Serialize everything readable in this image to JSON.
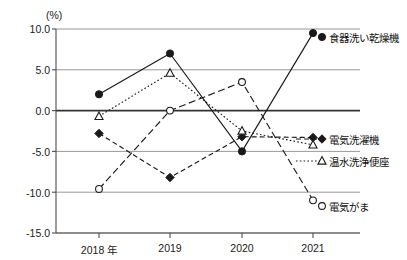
{
  "axis": {
    "unit": "(%)",
    "y_ticks": [
      "10.0",
      "5.0",
      "0.0",
      "-5.0",
      "-10.0",
      "-15.0"
    ],
    "x_ticks": [
      "2018 年",
      "2019",
      "2020",
      "2021"
    ]
  },
  "legend": [
    {
      "label": "食器洗い乾燥機",
      "marker": "filled-circle",
      "line": "solid"
    },
    {
      "label": "電気洗濯機",
      "marker": "filled-diamond",
      "line": "dashed"
    },
    {
      "label": "温水洗浄便座",
      "marker": "open-triangle",
      "line": "dotted"
    },
    {
      "label": "電気がま",
      "marker": "open-circle",
      "line": "dashdot"
    }
  ],
  "colors": {
    "axis": "#4d4d4d",
    "grid": "#8c8c8c",
    "zero_line": "#333333",
    "series": "#1a1a1a",
    "background": "#ffffff"
  },
  "chart_data": {
    "type": "line",
    "title": "",
    "subtitle": "",
    "xlabel": "",
    "ylabel": "(%)",
    "categories": [
      "2018 年",
      "2019",
      "2020",
      "2021"
    ],
    "x": [
      2018,
      2019,
      2020,
      2021
    ],
    "ylim": [
      -15.0,
      10.0
    ],
    "y_ticks": [
      10.0,
      5.0,
      0.0,
      -5.0,
      -10.0,
      -15.0
    ],
    "grid": true,
    "legend_position": "right-inline",
    "series": [
      {
        "name": "食器洗い乾燥機",
        "marker": "filled-circle",
        "line": "solid",
        "values": [
          2.0,
          7.0,
          -5.0,
          9.5
        ]
      },
      {
        "name": "電気洗濯機",
        "marker": "filled-diamond",
        "line": "dashed",
        "values": [
          -2.8,
          -8.2,
          -3.2,
          -3.3
        ]
      },
      {
        "name": "温水洗浄便座",
        "marker": "open-triangle",
        "line": "dotted",
        "values": [
          -0.7,
          4.6,
          -2.5,
          -4.2
        ]
      },
      {
        "name": "電気がま",
        "marker": "open-circle",
        "line": "dashdot",
        "values": [
          -9.6,
          0.0,
          3.5,
          -11.0
        ]
      }
    ]
  }
}
